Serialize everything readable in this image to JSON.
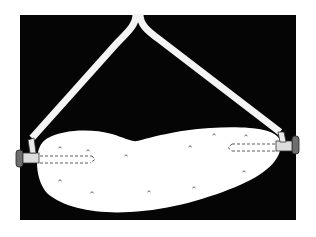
{
  "illustration": {
    "subject": "pickle with electrodes connected by two wires",
    "colors": {
      "background": "#ffffff",
      "panel": "#050505",
      "pickle": "#ffffff",
      "wire": "#f4f4f4",
      "electrode": "#6e6e6e",
      "dash": "#333333"
    }
  }
}
